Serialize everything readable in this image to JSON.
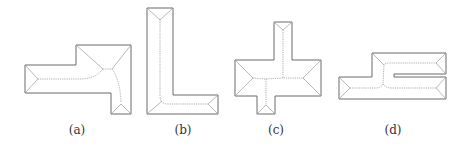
{
  "figure": {
    "panels": [
      {
        "id": "a",
        "label": "(a)",
        "shape": "stepped-L roof with curved ridge"
      },
      {
        "id": "b",
        "label": "(b)",
        "shape": "L-shaped roof"
      },
      {
        "id": "c",
        "label": "(c)",
        "shape": "cross-shaped roof"
      },
      {
        "id": "d",
        "label": "(d)",
        "shape": "C-shaped roof with slot"
      }
    ],
    "colors": {
      "outline": "#6a6a6a",
      "skeleton": "#9a9a9a",
      "background": "#ffffff"
    }
  }
}
